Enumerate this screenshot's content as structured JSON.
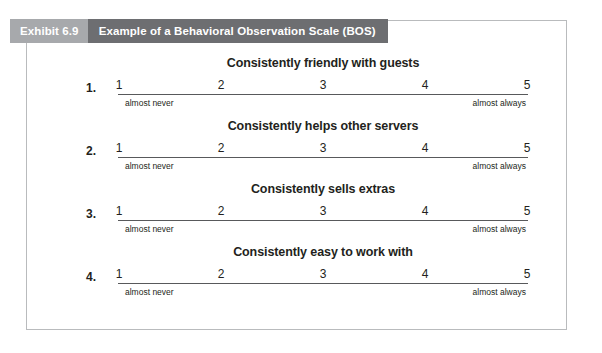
{
  "exhibit": {
    "label": "Exhibit 6.9",
    "title": "Example of a Behavioral Observation Scale (BOS)"
  },
  "scale": {
    "points": [
      "1",
      "2",
      "3",
      "4",
      "5"
    ],
    "anchor_left": "almost never",
    "anchor_right": "almost always"
  },
  "items": [
    {
      "number": "1.",
      "heading": "Consistently friendly with guests",
      "points": [
        "1",
        "2",
        "3",
        "4",
        "5"
      ],
      "anchor_left": "almost never",
      "anchor_right": "almost always"
    },
    {
      "number": "2.",
      "heading": "Consistently helps other servers",
      "points": [
        "1",
        "2",
        "3",
        "4",
        "5"
      ],
      "anchor_left": "almost never",
      "anchor_right": "almost always"
    },
    {
      "number": "3.",
      "heading": "Consistently sells extras",
      "points": [
        "1",
        "2",
        "3",
        "4",
        "5"
      ],
      "anchor_left": "almost never",
      "anchor_right": "almost always"
    },
    {
      "number": "4.",
      "heading": "Consistently easy to work with",
      "points": [
        "1",
        "2",
        "3",
        "4",
        "5"
      ],
      "anchor_left": "almost never",
      "anchor_right": "almost always"
    }
  ],
  "colors": {
    "label_band": "#a7a9ac",
    "title_band": "#6d6e71",
    "panel_border": "#b9bbbd",
    "rule": "#58595b",
    "text": "#231f20",
    "background": "#ffffff"
  }
}
